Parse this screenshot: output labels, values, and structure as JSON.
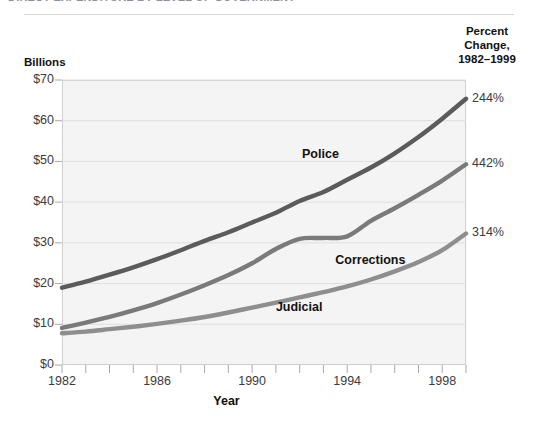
{
  "figure": {
    "title_clipped": "DIRECT EXPENDITURE BY LEVEL OF GOVERNMENT",
    "billions_label": "Billions",
    "percent_header_line1": "Percent",
    "percent_header_line2": "Change,",
    "percent_header_line3": "1982–1999",
    "year_axis_label": "Year"
  },
  "chart_data": {
    "type": "line",
    "xlabel": "Year",
    "ylabel": "Billions",
    "ylim": [
      0,
      70
    ],
    "xlim": [
      1982,
      1999
    ],
    "grid": true,
    "legend_position": "inline-callout",
    "ytick_labels": [
      "$0",
      "$10",
      "$20",
      "$30",
      "$40",
      "$50",
      "$60",
      "$70"
    ],
    "ytick_values": [
      0,
      10,
      20,
      30,
      40,
      50,
      60,
      70
    ],
    "xtick_labels": [
      "1982",
      "1986",
      "1990",
      "1994",
      "1998"
    ],
    "xtick_values": [
      1982,
      1986,
      1990,
      1994,
      1998
    ],
    "x": [
      1982,
      1983,
      1984,
      1985,
      1986,
      1987,
      1988,
      1989,
      1990,
      1991,
      1992,
      1993,
      1994,
      1995,
      1996,
      1997,
      1998,
      1999
    ],
    "series": [
      {
        "name": "Police",
        "color": "#5b5b5b",
        "percent_change": "244%",
        "label_x": 1992.1,
        "label_y": 51.5,
        "values": [
          19.0,
          20.5,
          22.2,
          24.0,
          26.0,
          28.2,
          30.5,
          32.6,
          35.0,
          37.4,
          40.3,
          42.5,
          45.5,
          48.5,
          52.0,
          56.0,
          60.5,
          65.4
        ]
      },
      {
        "name": "Corrections",
        "color": "#7a7a7a",
        "percent_change": "442%",
        "label_x": 1993.5,
        "label_y": 25.5,
        "values": [
          9.1,
          10.4,
          11.8,
          13.4,
          15.2,
          17.3,
          19.6,
          22.1,
          25.0,
          28.5,
          31.0,
          31.2,
          31.6,
          35.4,
          38.5,
          41.8,
          45.3,
          49.3
        ]
      },
      {
        "name": "Judicial",
        "color": "#8e8e8e",
        "percent_change": "314%",
        "label_x": 1991.0,
        "label_y": 14.0,
        "values": [
          7.8,
          8.2,
          8.8,
          9.4,
          10.1,
          10.9,
          11.8,
          12.9,
          14.1,
          15.3,
          16.6,
          17.9,
          19.3,
          21.0,
          23.0,
          25.3,
          28.2,
          32.3
        ]
      }
    ]
  }
}
